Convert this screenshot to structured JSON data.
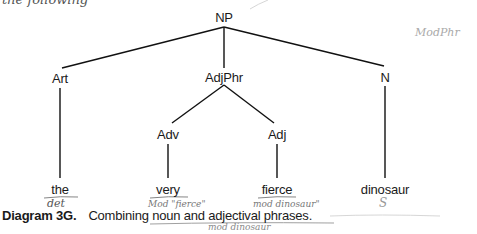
{
  "diagram": {
    "type": "syntax-tree",
    "top_fragment": "the following",
    "nodes": {
      "root": {
        "label": "NP",
        "x": 224,
        "y": 17
      },
      "art": {
        "label": "Art",
        "x": 60,
        "y": 78
      },
      "adjphr": {
        "label": "AdjPhr",
        "x": 224,
        "y": 77
      },
      "n": {
        "label": "N",
        "x": 385,
        "y": 77
      },
      "adv": {
        "label": "Adv",
        "x": 168,
        "y": 134
      },
      "adj": {
        "label": "Adj",
        "x": 277,
        "y": 134
      }
    },
    "leaves": {
      "the": {
        "label": "the",
        "x": 60,
        "y": 190
      },
      "very": {
        "label": "very",
        "x": 168,
        "y": 190
      },
      "fierce": {
        "label": "fierce",
        "x": 277,
        "y": 190
      },
      "dinosaur": {
        "label": "dinosaur",
        "x": 385,
        "y": 190
      }
    },
    "edges": [
      [
        "root",
        "art"
      ],
      [
        "root",
        "adjphr"
      ],
      [
        "root",
        "n"
      ],
      [
        "adjphr",
        "adv"
      ],
      [
        "adjphr",
        "adj"
      ],
      [
        "art",
        "the"
      ],
      [
        "adv",
        "very"
      ],
      [
        "adj",
        "fierce"
      ],
      [
        "n",
        "dinosaur"
      ]
    ],
    "caption": {
      "label": "Diagram 3G.",
      "text": "Combining noun and adjectival phrases."
    },
    "handwritten_annotations": {
      "corner_note": "ModPhr",
      "under_the": "det",
      "under_very": "Mod \"fierce\"",
      "under_fierce": "mod dinosaur\"",
      "under_dinosaur": "S",
      "under_caption": "mod dinosaur"
    }
  }
}
